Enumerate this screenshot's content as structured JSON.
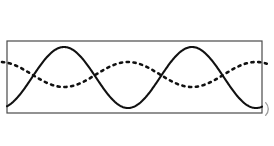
{
  "figure": {
    "canvas_width": 274,
    "canvas_height": 146,
    "background_color": "#ffffff"
  },
  "frame": {
    "name": "panel-border",
    "x": 7,
    "y": 41,
    "width": 255,
    "height": 72,
    "stroke_color": "#4a4a4a",
    "stroke_width": 1.2,
    "fill_color": "#ffffff"
  },
  "chart_data": {
    "type": "line",
    "subtitle": "",
    "xlabel": "",
    "ylabel": "",
    "xlim": [
      7,
      262
    ],
    "ylim": [
      41,
      113
    ],
    "grid": false,
    "legend_position": "none",
    "tick_labels_x": [],
    "tick_labels_y": [],
    "annotations": [],
    "series": [
      {
        "name": "solid-wave",
        "style": "solid",
        "color": "#111111",
        "stroke_width": 2.1,
        "amplitude": 30.5,
        "wavelength": 128,
        "midline_y": 77.5,
        "phase_deg": 270,
        "cycles": 2,
        "peak_y": 47,
        "trough_y": 108,
        "peaks_x": [
          68,
          196
        ],
        "troughs_x": [
          4,
          132,
          260
        ],
        "zero_crossings_x": [
          36,
          100,
          164,
          228
        ]
      },
      {
        "name": "dashed-wave",
        "style": "dotted",
        "color": "#111111",
        "stroke_width": 2.6,
        "dash_pattern": "2.2 4.6",
        "amplitude": 12.5,
        "wavelength": 128,
        "midline_y": 74.5,
        "phase_deg": 90,
        "cycles": 2,
        "peak_y": 62,
        "trough_y": 87,
        "peaks_x": [
          4,
          132,
          260
        ],
        "troughs_x": [
          68,
          196
        ],
        "zero_crossings_x": [
          36,
          100,
          164,
          228
        ]
      }
    ]
  },
  "edge_mark": {
    "name": "right-edge-arc",
    "shape": "open-parenthesis-arc",
    "color": "#9a9a9a",
    "stroke_width": 1.3,
    "cx": 272,
    "cy": 109,
    "r": 9
  }
}
